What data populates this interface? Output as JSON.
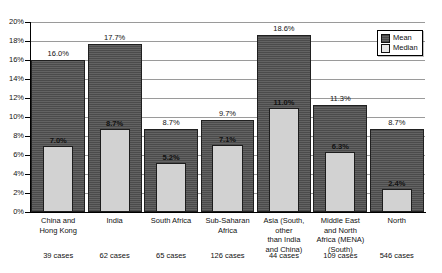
{
  "chart_data": {
    "type": "bar",
    "title": "",
    "xlabel": "",
    "ylabel": "",
    "ylim": [
      0,
      20
    ],
    "ytick_step": 2,
    "grid": true,
    "legend_position": "top-right",
    "value_suffix": "%",
    "categories": [
      "China and Hong Kong",
      "India",
      "South Africa",
      "Sub-Saharan Africa",
      "Asia (South, other than India and China)",
      "Middle East and North Africa (MENA) (South)",
      "North"
    ],
    "category_lines": [
      [
        "China and",
        "Hong Kong"
      ],
      [
        "India"
      ],
      [
        "South Africa"
      ],
      [
        "Sub-Saharan",
        "Africa"
      ],
      [
        "Asia (South,",
        "other",
        "than India",
        "and China)"
      ],
      [
        "Middle East",
        "and North",
        "Africa (MENA)",
        "(South)"
      ],
      [
        "North"
      ]
    ],
    "series": [
      {
        "name": "Mean",
        "color": "#5b5b5b",
        "values": [
          16.0,
          17.7,
          8.7,
          9.7,
          18.6,
          11.3,
          8.7
        ],
        "labels": [
          "16.0%",
          "17.7%",
          "8.7%",
          "9.7%",
          "18.6%",
          "11.3%",
          "8.7%"
        ]
      },
      {
        "name": "Median",
        "color": "#d2d2d2",
        "values": [
          7.0,
          8.7,
          5.2,
          7.1,
          11.0,
          6.3,
          2.4
        ],
        "labels": [
          "7.0%",
          "8.7%",
          "5.2%",
          "7.1%",
          "11.0%",
          "6.3%",
          "2.4%"
        ]
      }
    ],
    "ytick_labels": [
      "0%",
      "2%",
      "4%",
      "6%",
      "8%",
      "10%",
      "12%",
      "14%",
      "16%",
      "18%",
      "20%"
    ],
    "cases": [
      "39 cases",
      "62 cases",
      "65 cases",
      "126 cases",
      "44 cases",
      "109 cases",
      "546 cases"
    ]
  },
  "legend": {
    "items": [
      {
        "label": "Mean",
        "swatch": "mean-swatch"
      },
      {
        "label": "Median",
        "swatch": "median-swatch"
      }
    ]
  }
}
